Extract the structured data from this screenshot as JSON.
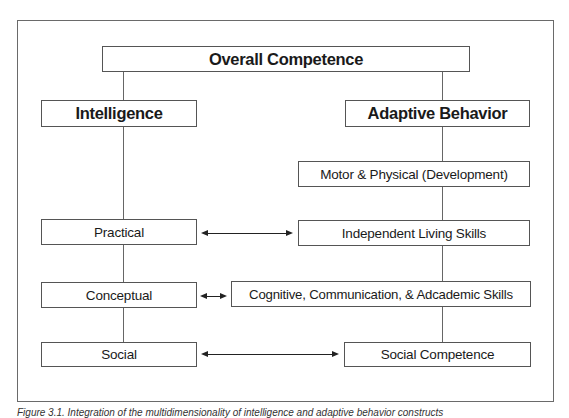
{
  "diagram": {
    "root": {
      "label": "Overall Competence"
    },
    "left_branch": {
      "header": "Intelligence",
      "items": [
        {
          "label": "Practical"
        },
        {
          "label": "Conceptual"
        },
        {
          "label": "Social"
        }
      ]
    },
    "right_branch": {
      "header": "Adaptive Behavior",
      "items": [
        {
          "label": "Motor & Physical (Development)"
        },
        {
          "label": "Independent Living Skills"
        },
        {
          "label": "Cognitive, Communication, & Adcademic Skills"
        },
        {
          "label": "Social Competence"
        }
      ]
    },
    "connections": [
      {
        "from": "Practical",
        "to": "Independent Living Skills",
        "type": "bidirectional-arrow"
      },
      {
        "from": "Conceptual",
        "to": "Cognitive, Communication, & Adcademic Skills",
        "type": "bidirectional-arrow"
      },
      {
        "from": "Social",
        "to": "Social Competence",
        "type": "bidirectional-arrow"
      }
    ],
    "caption": "Figure 3.1. Integration of the multidimensionality of intelligence and adaptive behavior constructs"
  }
}
